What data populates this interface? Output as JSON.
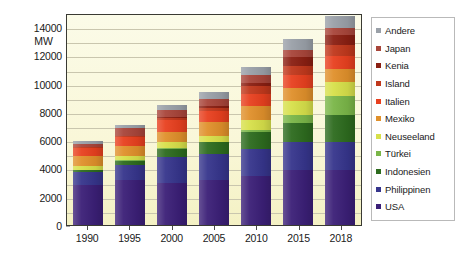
{
  "chart_data": {
    "type": "bar",
    "subtype": "stacked-bar",
    "title": "",
    "xlabel": "",
    "ylabel": "MW",
    "unit_label": "MW",
    "ylim": [
      0,
      15000
    ],
    "ytick_values": [
      0,
      2000,
      4000,
      6000,
      8000,
      10000,
      12000,
      14000
    ],
    "ytick_labels": [
      "0",
      "2000",
      "4000",
      "6000",
      "8000",
      "10000",
      "12000",
      "14000"
    ],
    "gridlines": true,
    "gridline_values": [
      1000,
      2000,
      3000,
      4000,
      5000,
      6000,
      7000,
      8000,
      9000,
      10000,
      11000,
      12000,
      13000,
      14000
    ],
    "legend_position": "right",
    "categories": [
      "1990",
      "1995",
      "2000",
      "2005",
      "2010",
      "2015",
      "2018"
    ],
    "stack_order_bottom_to_top": [
      "USA",
      "Philippinen",
      "Indonesien",
      "Türkei",
      "Neuseeland",
      "Mexiko",
      "Italien",
      "Island",
      "Kenia",
      "Japan",
      "Andere"
    ],
    "series": [
      {
        "name": "USA",
        "color": "#3b1f77",
        "values": [
          2800,
          3200,
          2950,
          3200,
          3500,
          3900,
          3900
        ]
      },
      {
        "name": "Philippinen",
        "color": "#36358c",
        "values": [
          950,
          1050,
          1850,
          1800,
          1900,
          1950,
          1950
        ]
      },
      {
        "name": "Indonesien",
        "color": "#2d6b1e",
        "values": [
          150,
          300,
          600,
          850,
          1200,
          1350,
          1950
        ]
      },
      {
        "name": "Türkei",
        "color": "#7ab648",
        "values": [
          20,
          20,
          20,
          20,
          100,
          600,
          1300
        ]
      },
      {
        "name": "Neuseeland",
        "color": "#d7e04a",
        "values": [
          280,
          290,
          440,
          440,
          750,
          950,
          1000
        ]
      },
      {
        "name": "Mexiko",
        "color": "#e0902b",
        "values": [
          700,
          750,
          750,
          950,
          960,
          950,
          950
        ]
      },
      {
        "name": "Italien",
        "color": "#e8401f",
        "values": [
          550,
          630,
          790,
          810,
          880,
          920,
          920
        ]
      },
      {
        "name": "Island",
        "color": "#c0381c",
        "values": [
          45,
          50,
          170,
          200,
          580,
          660,
          760
        ]
      },
      {
        "name": "Kenia",
        "color": "#8a1f12",
        "values": [
          45,
          45,
          45,
          130,
          200,
          600,
          700
        ]
      },
      {
        "name": "Japan",
        "color": "#a8453a",
        "values": [
          215,
          530,
          530,
          530,
          540,
          520,
          530
        ]
      },
      {
        "name": "Andere",
        "color": "#9aa0a8",
        "values": [
          195,
          235,
          355,
          520,
          590,
          800,
          840
        ]
      }
    ],
    "bar_totals": [
      5950,
      7100,
      8450,
      9450,
      11200,
      13200,
      14800
    ],
    "source_note": ""
  },
  "yaxis": {
    "unit": "MW",
    "ticks": [
      "14000",
      "12000",
      "10000",
      "8000",
      "6000",
      "4000",
      "2000",
      "0"
    ]
  },
  "xaxis": {
    "ticks": [
      "1990",
      "1995",
      "2000",
      "2005",
      "2010",
      "2015",
      "2018"
    ]
  },
  "legend": {
    "items": [
      {
        "label": "Andere",
        "color": "#9aa0a8"
      },
      {
        "label": "Japan",
        "color": "#a8453a"
      },
      {
        "label": "Kenia",
        "color": "#8a1f12"
      },
      {
        "label": "Island",
        "color": "#c0381c"
      },
      {
        "label": "Italien",
        "color": "#e8401f"
      },
      {
        "label": "Mexiko",
        "color": "#e0902b"
      },
      {
        "label": "Neuseeland",
        "color": "#d7e04a"
      },
      {
        "label": "Türkei",
        "color": "#7ab648"
      },
      {
        "label": "Indonesien",
        "color": "#2d6b1e"
      },
      {
        "label": "Philippinen",
        "color": "#36358c"
      },
      {
        "label": "USA",
        "color": "#3b1f77"
      }
    ]
  },
  "colors": {
    "plot_background": "#f9f7d8",
    "frame": "#3a3a33",
    "gridline": "#c9c6ae",
    "text": "#1a1a1a",
    "legend_border": "#b9b9b9"
  }
}
